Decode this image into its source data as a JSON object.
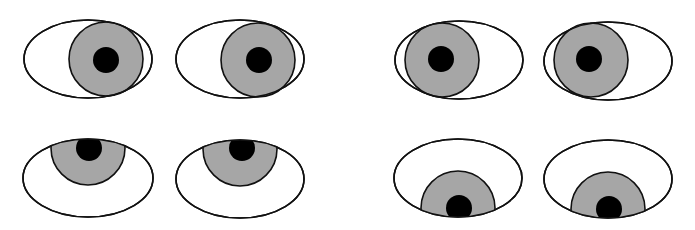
{
  "colors": {
    "background": "#ffffff",
    "sclera": "#ffffff",
    "iris": "#a6a6a6",
    "pupil": "#000000",
    "outline": "#111111"
  },
  "eye_pairs": [
    {
      "name": "looking-right",
      "eyes": [
        {
          "ellipse": {
            "cx": 88,
            "cy": 59,
            "rx": 64,
            "ry": 39
          },
          "iris": {
            "cx": 106,
            "cy": 59,
            "r": 37
          },
          "pupil": {
            "cx": 106,
            "cy": 60,
            "r": 13
          },
          "clip_iris": false
        },
        {
          "ellipse": {
            "cx": 240,
            "cy": 59,
            "rx": 64,
            "ry": 39
          },
          "iris": {
            "cx": 258,
            "cy": 60,
            "r": 37
          },
          "pupil": {
            "cx": 259,
            "cy": 60,
            "r": 13
          },
          "clip_iris": false
        }
      ]
    },
    {
      "name": "looking-left",
      "eyes": [
        {
          "ellipse": {
            "cx": 459,
            "cy": 60,
            "rx": 64,
            "ry": 39
          },
          "iris": {
            "cx": 442,
            "cy": 60,
            "r": 37
          },
          "pupil": {
            "cx": 441,
            "cy": 59,
            "r": 13
          },
          "clip_iris": false
        },
        {
          "ellipse": {
            "cx": 608,
            "cy": 61,
            "rx": 64,
            "ry": 39
          },
          "iris": {
            "cx": 591,
            "cy": 60,
            "r": 37
          },
          "pupil": {
            "cx": 589,
            "cy": 59,
            "r": 13
          },
          "clip_iris": false
        }
      ]
    },
    {
      "name": "looking-up",
      "eyes": [
        {
          "ellipse": {
            "cx": 88,
            "cy": 178,
            "rx": 65,
            "ry": 39
          },
          "iris": {
            "cx": 88,
            "cy": 148,
            "r": 37
          },
          "pupil": {
            "cx": 89,
            "cy": 148,
            "r": 13
          },
          "clip_iris": true
        },
        {
          "ellipse": {
            "cx": 240,
            "cy": 179,
            "rx": 64,
            "ry": 39
          },
          "iris": {
            "cx": 240,
            "cy": 149,
            "r": 37
          },
          "pupil": {
            "cx": 242,
            "cy": 148,
            "r": 13
          },
          "clip_iris": true
        }
      ]
    },
    {
      "name": "looking-down",
      "eyes": [
        {
          "ellipse": {
            "cx": 458,
            "cy": 178,
            "rx": 64,
            "ry": 39
          },
          "iris": {
            "cx": 458,
            "cy": 208,
            "r": 37
          },
          "pupil": {
            "cx": 459,
            "cy": 208,
            "r": 13
          },
          "clip_iris": true
        },
        {
          "ellipse": {
            "cx": 608,
            "cy": 179,
            "rx": 64,
            "ry": 39
          },
          "iris": {
            "cx": 608,
            "cy": 209,
            "r": 37
          },
          "pupil": {
            "cx": 609,
            "cy": 209,
            "r": 13
          },
          "clip_iris": true
        }
      ]
    }
  ]
}
